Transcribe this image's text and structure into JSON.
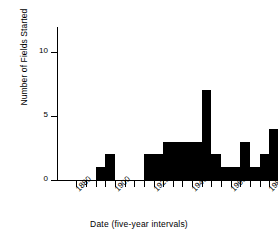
{
  "chart_data": {
    "type": "bar",
    "title": "",
    "xlabel": "Date (five-year intervals)",
    "ylabel": "Number of Fields Started",
    "xlim": [
      1870,
      1985
    ],
    "ylim": [
      0,
      12
    ],
    "grid": false,
    "legend": null,
    "bin_width": 5,
    "xticks": [
      1880,
      1900,
      1920,
      1940,
      1960,
      1980
    ],
    "xtick_labels": [
      "1880",
      "1900",
      "1920",
      "1940",
      "1960",
      "1980"
    ],
    "yticks": [
      0,
      5,
      10
    ],
    "ytick_labels": [
      "0",
      "5",
      "10"
    ],
    "bar_color": "#000000",
    "categories": [
      "1875",
      "1880",
      "1885",
      "1890",
      "1895",
      "1900",
      "1905",
      "1910",
      "1915",
      "1920",
      "1925",
      "1930",
      "1935",
      "1940",
      "1945",
      "1950",
      "1955",
      "1960",
      "1965",
      "1970",
      "1975",
      "1980"
    ],
    "values": [
      0,
      0,
      0,
      1,
      2,
      0,
      0,
      0,
      2,
      2,
      3,
      3,
      3,
      3,
      7,
      2,
      1,
      1,
      3,
      1,
      2,
      4
    ]
  }
}
